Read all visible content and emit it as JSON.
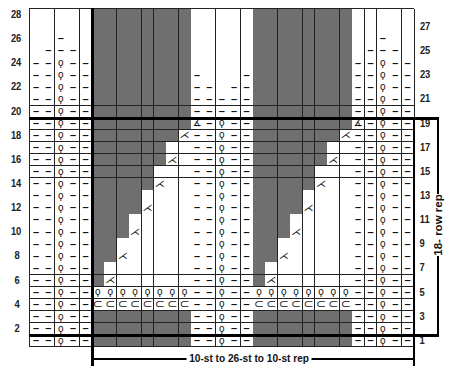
{
  "chart_title": "",
  "grid": {
    "columns": 31,
    "rows": 28,
    "left": 30,
    "top": 9,
    "cell_w": 12.39,
    "cell_h": 12.07
  },
  "colors": {
    "no_stitch": "#6f6f6f",
    "stitch": "#ffffff",
    "lines": "#222222",
    "rep_lines": "#000000"
  },
  "symbols": {
    "P": "–",
    "Q": "ϙ",
    "C": "⊂",
    "D": "⋌",
    "T": "∡",
    "G": "",
    "B": ""
  },
  "legend_meaning": {
    "P": "purl",
    "Q": "knit tbl (twisted)",
    "C": "wrap/yo",
    "D": "decrease",
    "T": "special decrease",
    "G": "no stitch",
    "B": "knit"
  },
  "row_labels_left": [
    "2",
    "4",
    "6",
    "8",
    "10",
    "12",
    "14",
    "16",
    "18",
    "20",
    "22",
    "24",
    "26",
    "28"
  ],
  "row_labels_right": [
    "1",
    "3",
    "5",
    "7",
    "9",
    "11",
    "13",
    "15",
    "17",
    "19",
    "21",
    "23",
    "25",
    "27"
  ],
  "rows_top_to_bottom": [
    "BBBBBGGGGGGGGBBBBBGGGGGGGGBBBBB",
    "BBBBBGGGGGGGGBBBBBGGGGGGGGBBBBB",
    "BBPBBGGGGGGGGBBBBBGGGGGGGGBBPBB",
    "BPPPBGGGGGGGGBBBBBGGGGGGGGBPPPB",
    "PPQPPGGGGGGGGBBBBBGGGGGGGGPPQPP",
    "PPQPPGGGGGGGGPBBBPGGGGGGGGPPQPP",
    "PPQPPGGGGGGGGPPBPPGGGGGGGGPPQPP",
    "PPQPPGGGGGGGGPPPPPGGGGGGGGPPQPP",
    "PPQPPGGGGGGGGPPPPPGGGGGGGGPPQPP",
    "PPQPPGGGGGGGGTPQPPGGGGGGGGTPQPP",
    "PPQPPGGGGGGGDPPQPPGGGGGGGDPPQPP",
    "PPQPPGGGGGGBBPPQPPGGGGGGBBPPQPP",
    "PPQPPGGGGGGDBPPQPPGGGGGGDBPPQPP",
    "PPQPPGGGGGBBBPPQPPGGGGGBBBPPQPP",
    "PPQPPGGGGGDBBPPQPPGGGGGDBBPPQPP",
    "PPQPPGGGGBBBBPPQPPGGGGBBBBPPQPP",
    "PPQPPGGGGDBBBPPQPPGGGGDBBBPPQPP",
    "PPQPPGGGBBBBBPPQPPGGGBBBBBPPQPP",
    "PPQPPGGGDBBBBPPQPPGGGDBBBBPPQPP",
    "PPQPPGGBBBBBBPPQPPGGBBBBBBPPQPP",
    "PPQPPGGDBBBBBPPQPPGGDBBBBBPPQPP",
    "PPQPPGBBBBBBBPPQPPGBBBBBBBPPQPP",
    "PPQPPGDBBBBBBPPQPPGDBBBBBBPPQPP",
    "PPQPPQQQQQQQQPPQPPQQQQQQQQPPQPP",
    "PPQPPCCCCCCCCPPQPPCCCCCCCCPPQPP",
    "PPQPPGGGGGGGGPPQPPGGGGGGGGPPQPP",
    "PPQPPGGGGGGGGPPQPPGGGGGGGGPPQPP",
    "PPQPPGGGGGGGGPPQPPGGGGGGGGPPQPP"
  ],
  "annotations": {
    "bottom_rep": "10-st to 26-st to 10-st rep",
    "side_rep": "18- row rep"
  },
  "chart_data": {
    "type": "table",
    "stitch_count_visible": 31,
    "row_count": 28,
    "repeat": {
      "rows_from": 2,
      "rows_to": 19,
      "rows_total": 18,
      "stitch_rep_label": "10-st to 26-st to 10-st rep"
    },
    "sections_stitches": [
      5,
      8,
      5,
      8,
      5
    ]
  }
}
